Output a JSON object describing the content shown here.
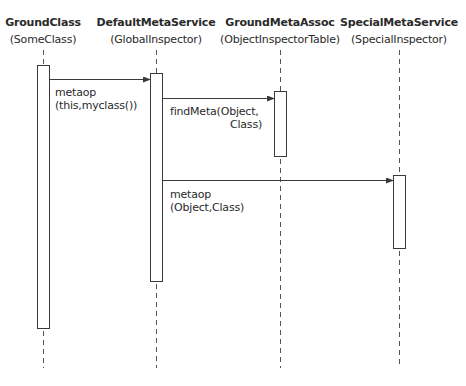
{
  "diagram": {
    "type": "sequence",
    "lifelines": [
      {
        "name": "GroundClass",
        "class": "(SomeClass)",
        "x": 43,
        "activation": {
          "x": 37,
          "y1": 65,
          "y2": 328
        }
      },
      {
        "name": "DefaultMetaService",
        "class": "(GlobalInspector)",
        "x": 156,
        "activation": {
          "x": 150,
          "y1": 73,
          "y2": 281
        }
      },
      {
        "name": "GroundMetaAssoc",
        "class": "(ObjectInspectorTable)",
        "x": 280,
        "activation": {
          "x": 274,
          "y1": 91,
          "y2": 156
        }
      },
      {
        "name": "SpecialMetaService",
        "class": "(SpecialInspector)",
        "x": 399,
        "activation": {
          "x": 393,
          "y1": 175,
          "y2": 248
        }
      }
    ],
    "messages": [
      {
        "from": 0,
        "to": 1,
        "y": 79,
        "line1": "metaop",
        "line2": "(this,myclass())"
      },
      {
        "from": 1,
        "to": 2,
        "y": 98,
        "line1": "findMeta(Object,",
        "line2": "Class)"
      },
      {
        "from": 1,
        "to": 3,
        "y": 180,
        "line1": "metaop",
        "line2": "(Object,Class)"
      }
    ],
    "colors": {
      "line": "#3a3a3a",
      "text": "#2a2a2a",
      "background": "#ffffff"
    }
  }
}
